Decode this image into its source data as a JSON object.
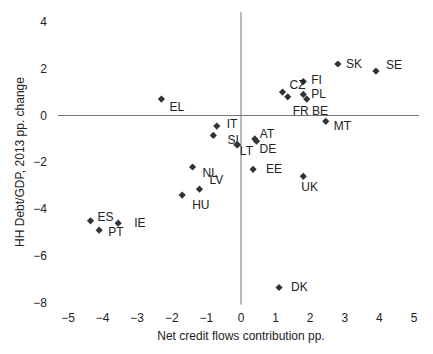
{
  "chart_data": {
    "type": "scatter",
    "title": "",
    "xlabel": "Net credit flows contribution pp.",
    "ylabel": "HH Debt/GDP, 2013 pp. change",
    "xlim": [
      -5,
      5
    ],
    "ylim": [
      -8,
      4
    ],
    "xticks": [
      -5,
      -4,
      -3,
      -2,
      -1,
      0,
      1,
      2,
      3,
      4,
      5
    ],
    "yticks": [
      4,
      2,
      0,
      -2,
      -4,
      -6,
      -8
    ],
    "xtick_labels": [
      "−5",
      "−4",
      "−3",
      "−2",
      "−1",
      "0",
      "1",
      "2",
      "3",
      "4",
      "5"
    ],
    "ytick_labels": [
      "4",
      "2",
      "0",
      "−2",
      "−4",
      "−6",
      "−8"
    ],
    "grid": false,
    "legend": null,
    "marker": "diamond",
    "marker_color": "#333333",
    "axis_line_color": "#777777",
    "points": [
      {
        "label": "SK",
        "x": 2.8,
        "y": 2.2,
        "lx": 8,
        "ly": 4
      },
      {
        "label": "SE",
        "x": 3.9,
        "y": 1.9,
        "lx": 10,
        "ly": -2
      },
      {
        "label": "FI",
        "x": 1.8,
        "y": 1.45,
        "lx": 8,
        "ly": 2
      },
      {
        "label": "CZ",
        "x": 1.2,
        "y": 1.0,
        "lx": 7,
        "ly": -3
      },
      {
        "label": "",
        "x": 1.35,
        "y": 0.8,
        "lx": 0,
        "ly": 0
      },
      {
        "label": "PL",
        "x": 1.8,
        "y": 0.9,
        "lx": 8,
        "ly": 4
      },
      {
        "label": "FR BE",
        "x": 1.9,
        "y": 0.7,
        "lx": -14,
        "ly": 16
      },
      {
        "label": "MT",
        "x": 2.45,
        "y": -0.25,
        "lx": 8,
        "ly": 9
      },
      {
        "label": "EL",
        "x": -2.3,
        "y": 0.7,
        "lx": 8,
        "ly": 12
      },
      {
        "label": "IT",
        "x": -0.7,
        "y": -0.45,
        "lx": 10,
        "ly": 2
      },
      {
        "label": "",
        "x": -0.8,
        "y": -0.85,
        "lx": 0,
        "ly": 0
      },
      {
        "label": "SI",
        "x": -0.1,
        "y": -1.25,
        "lx": -10,
        "ly": -1
      },
      {
        "label": "LT",
        "x": -0.12,
        "y": -1.25,
        "lx": 3,
        "ly": 10
      },
      {
        "label": "AT",
        "x": 0.4,
        "y": -1.0,
        "lx": 5,
        "ly": -1
      },
      {
        "label": "DE",
        "x": 0.45,
        "y": -1.1,
        "lx": 3,
        "ly": 12
      },
      {
        "label": "EE",
        "x": 0.35,
        "y": -2.3,
        "lx": 13,
        "ly": 4
      },
      {
        "label": "UK",
        "x": 1.8,
        "y": -2.6,
        "lx": -2,
        "ly": 15
      },
      {
        "label": "NL",
        "x": -1.4,
        "y": -2.2,
        "lx": 10,
        "ly": 10
      },
      {
        "label": "LV",
        "x": -1.2,
        "y": -3.15,
        "lx": 10,
        "ly": -5
      },
      {
        "label": "HU",
        "x": -1.7,
        "y": -3.4,
        "lx": 10,
        "ly": 14
      },
      {
        "label": "ES",
        "x": -4.35,
        "y": -4.5,
        "lx": 7,
        "ly": 0
      },
      {
        "label": "PT",
        "x": -4.1,
        "y": -4.9,
        "lx": 9,
        "ly": 6
      },
      {
        "label": "IE",
        "x": -3.55,
        "y": -4.6,
        "lx": 16,
        "ly": 4
      },
      {
        "label": "DK",
        "x": 1.1,
        "y": -7.35,
        "lx": 12,
        "ly": 4
      }
    ]
  }
}
